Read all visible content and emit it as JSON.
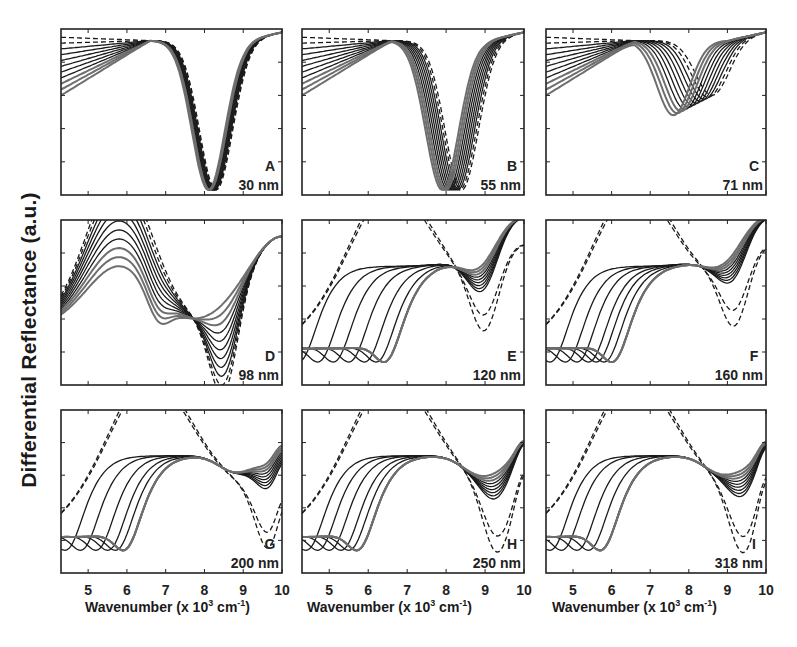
{
  "figure": {
    "ylabel": "Differential Reflectance (a.u.)",
    "xlabel_prefix": "Wavenumber (x 10",
    "xlabel_sup": "3",
    "xlabel_unit": " cm",
    "xlabel_unit_sup": "-1",
    "xlabel_suffix": ")",
    "x_ticks": [
      "5",
      "6",
      "7",
      "8",
      "9",
      "10"
    ],
    "line_color": "#1a1a1a",
    "gray_color": "#6e6e6e",
    "caption_faint": ""
  },
  "chart_data": [
    {
      "type": "line",
      "panel": "A",
      "thickness": "30 nm",
      "xlabel": "Wavenumber (x 10^3 cm^-1)",
      "ylabel": "Differential Reflectance (a.u.)",
      "xlim": [
        4.3,
        10
      ],
      "dip_center_solid": 8.1,
      "dip_center_dashed": 8.3,
      "description": "Deep single dip near 8.1; curves nearly overlapping",
      "series_count": 11
    },
    {
      "type": "line",
      "panel": "B",
      "thickness": "55 nm",
      "xlabel": "Wavenumber (x 10^3 cm^-1)",
      "ylabel": "Differential Reflectance (a.u.)",
      "xlim": [
        4.3,
        10
      ],
      "dip_center_solid": 7.9,
      "dip_center_dashed": 8.4,
      "description": "Deep dip near 7.9; hump near 6",
      "series_count": 11
    },
    {
      "type": "line",
      "panel": "C",
      "thickness": "71 nm",
      "xlabel": "Wavenumber (x 10^3 cm^-1)",
      "ylabel": "Differential Reflectance (a.u.)",
      "xlim": [
        4.3,
        10
      ],
      "dip_center_solid": 7.6,
      "dip_center_dashed": 8.6,
      "description": "Moderate dip near 7.6-8.6; isosbestic point near 8.1",
      "series_count": 11
    },
    {
      "type": "line",
      "panel": "D",
      "thickness": "98 nm",
      "xlabel": "Wavenumber (x 10^3 cm^-1)",
      "ylabel": "Differential Reflectance (a.u.)",
      "xlim": [
        4.3,
        10
      ],
      "crossing_point": 7.6,
      "dip_center_solid": 6.8,
      "dip_center_dashed": 8.5,
      "series_count": 11
    },
    {
      "type": "line",
      "panel": "E",
      "thickness": "120 nm",
      "xlabel": "Wavenumber (x 10^3 cm^-1)",
      "ylabel": "Differential Reflectance (a.u.)",
      "xlim": [
        4.3,
        10
      ],
      "crossing_point": 8.0,
      "dip_positions": [
        4.3,
        4.8,
        5.2,
        5.6,
        6.0,
        6.3,
        6.5
      ],
      "dashed_dip": 9.0,
      "series_count": 11
    },
    {
      "type": "line",
      "panel": "F",
      "thickness": "160 nm",
      "xlabel": "Wavenumber (x 10^3 cm^-1)",
      "ylabel": "Differential Reflectance (a.u.)",
      "xlim": [
        4.3,
        10
      ],
      "crossing_point": 8.0,
      "dip_positions": [
        4.5,
        4.9,
        5.2,
        5.5,
        5.7,
        5.9,
        6.1
      ],
      "dashed_dip": 9.2,
      "series_count": 11
    },
    {
      "type": "line",
      "panel": "G",
      "thickness": "200 nm",
      "xlabel": "Wavenumber (x 10^3 cm^-1)",
      "ylabel": "Differential Reflectance (a.u.)",
      "xlim": [
        4.3,
        10
      ],
      "crossing_point": 7.8,
      "dip_positions": [
        4.5,
        4.9,
        5.3,
        5.6,
        5.8,
        6.0
      ],
      "dashed_dip": 9.7,
      "series_count": 11
    },
    {
      "type": "line",
      "panel": "H",
      "thickness": "250 nm",
      "xlabel": "Wavenumber (x 10^3 cm^-1)",
      "ylabel": "Differential Reflectance (a.u.)",
      "xlim": [
        4.3,
        10
      ],
      "crossing_point": 7.7,
      "dip_positions": [
        4.5,
        4.8,
        5.1,
        5.4,
        5.6,
        5.8
      ],
      "dashed_dip": 9.3,
      "series_count": 11
    },
    {
      "type": "line",
      "panel": "I",
      "thickness": "318 nm",
      "xlabel": "Wavenumber (x 10^3 cm^-1)",
      "ylabel": "Differential Reflectance (a.u.)",
      "xlim": [
        4.3,
        10
      ],
      "crossing_point": 7.3,
      "dip_positions": [
        4.5,
        4.8,
        5.2,
        5.5,
        5.8
      ],
      "dashed_dip": 9.4,
      "series_count": 11
    }
  ]
}
